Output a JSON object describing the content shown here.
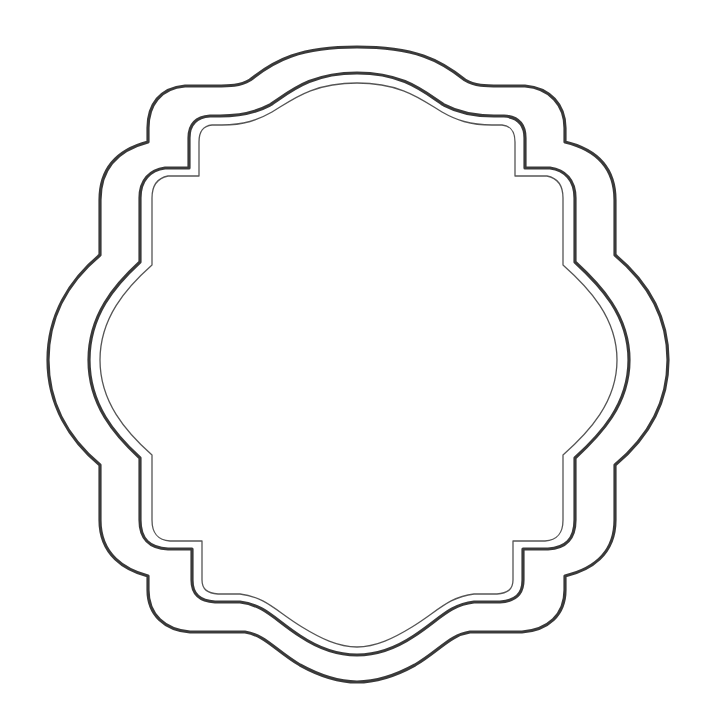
{
  "image": {
    "title": "Decorative scalloped frame",
    "description": "Three concentric ornate label frame outlines on a white background",
    "background_color": "#ffffff",
    "stroke_color": "#3a3a3a"
  },
  "frames": [
    {
      "name": "outer",
      "stroke_width": 3.2
    },
    {
      "name": "middle",
      "stroke_width": 3.2
    },
    {
      "name": "inner",
      "stroke_width": 1.3
    }
  ]
}
